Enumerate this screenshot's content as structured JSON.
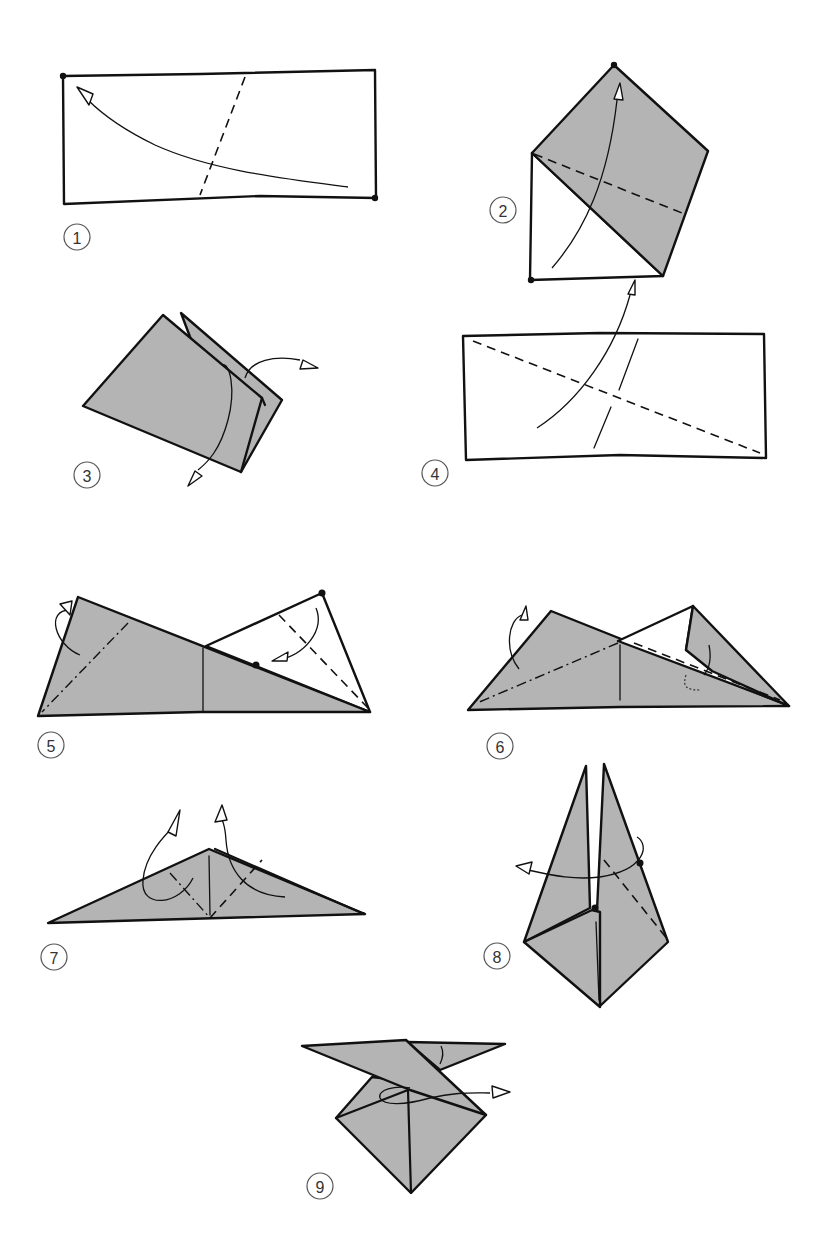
{
  "diagram": {
    "type": "origami instruction diagram",
    "background": "#ffffff",
    "paper_color_colored_side": "#b4b4b4",
    "paper_color_white_side": "#ffffff",
    "line_color": "#111111",
    "steps": [
      {
        "number": "1",
        "label": "Rectangle with valley-fold crease; fold bottom-right corner to top-left corner"
      },
      {
        "number": "2",
        "label": "Folded; valley-fold crease on colored flap, fold white corner up"
      },
      {
        "number": "3",
        "label": "Layered folded shape; unfold flaps"
      },
      {
        "number": "4",
        "label": "Rectangle with diagonal valley crease and short crease line; fold up"
      },
      {
        "number": "5",
        "label": "Triangle with mountain-fold on left, valley-fold on white flap"
      },
      {
        "number": "6",
        "label": "Mountain-fold on left, tuck flap inside along dashed line"
      },
      {
        "number": "7",
        "label": "Flattened triangle; pull layers up along valley folds"
      },
      {
        "number": "8",
        "label": "Tall pointed form; valley-fold and wrap around"
      },
      {
        "number": "9",
        "label": "Final shape; turn flap around"
      }
    ]
  }
}
